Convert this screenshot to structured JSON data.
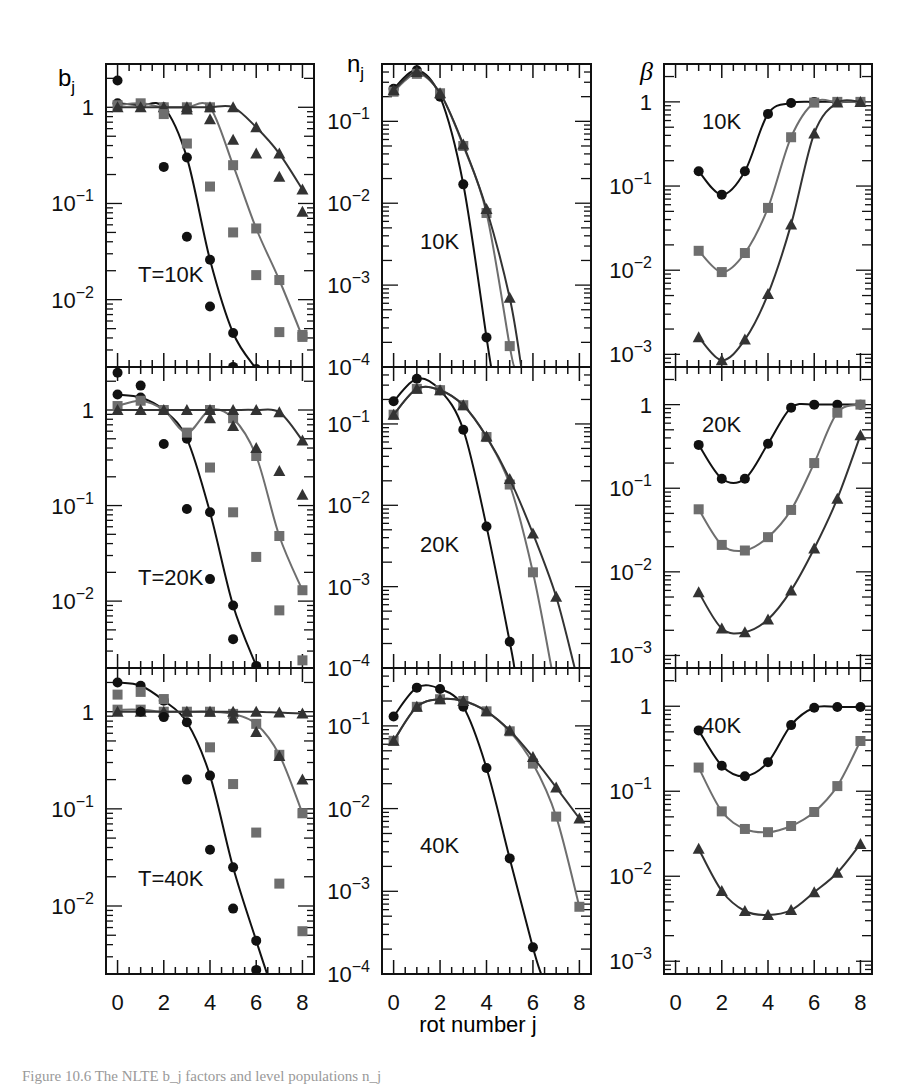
{
  "chart_data": {
    "type": "line",
    "layout": "3x3 grid of log-scale panels",
    "xlabel": "rot number j",
    "x_ticks": [
      0,
      2,
      4,
      6,
      8
    ],
    "x_range": [
      -0.5,
      8.5
    ],
    "column_ylabels": [
      "b_j",
      "n_j",
      "β"
    ],
    "series_styles": [
      {
        "name": "circles",
        "marker": "circle",
        "color": "#111111"
      },
      {
        "name": "squares",
        "marker": "square",
        "color": "#6e6e6e"
      },
      {
        "name": "triangles",
        "marker": "triangle",
        "color": "#333333"
      }
    ],
    "panels": [
      {
        "id": "bj-10K",
        "column": 0,
        "row": 0,
        "label": "T=10K",
        "ylabel": "b_j",
        "yticks": [
          "1",
          "10^-1",
          "10^-2"
        ],
        "ylog_range": [
          -2.7,
          0.45
        ],
        "curves": [
          {
            "marker": "circle",
            "x": [
              0,
              1,
              2,
              3,
              4,
              5,
              6
            ],
            "y": [
              1.1,
              1.05,
              1.0,
              0.3,
              0.026,
              0.0045,
              0.0019
            ]
          },
          {
            "marker": "square",
            "x": [
              0,
              1,
              2,
              3,
              4,
              5,
              6,
              7,
              8
            ],
            "y": [
              1.05,
              1.1,
              1.0,
              1.0,
              1.0,
              0.25,
              0.055,
              0.016,
              0.0041
            ]
          },
          {
            "marker": "triangle",
            "x": [
              0,
              1,
              2,
              3,
              4,
              5,
              6,
              7,
              8
            ],
            "y": [
              1.0,
              1.0,
              1.0,
              1.0,
              1.0,
              1.0,
              0.62,
              0.33,
              0.14
            ]
          }
        ],
        "scatter": [
          {
            "marker": "circle",
            "x": [
              0,
              2,
              3,
              4,
              5,
              6
            ],
            "y": [
              1.9,
              0.24,
              0.045,
              0.0085,
              0.002,
              0.00115
            ]
          },
          {
            "marker": "square",
            "x": [
              2,
              3,
              4,
              5,
              6,
              7,
              8
            ],
            "y": [
              0.85,
              0.42,
              0.15,
              0.05,
              0.018,
              0.0046,
              0.0043
            ]
          },
          {
            "marker": "triangle",
            "x": [
              3,
              4,
              5,
              6,
              7,
              8
            ],
            "y": [
              0.95,
              0.75,
              0.46,
              0.33,
              0.19,
              0.082
            ]
          }
        ]
      },
      {
        "id": "nj-10K",
        "column": 1,
        "row": 0,
        "label": "10K",
        "ylabel": "n_j",
        "yticks": [
          "10^-1",
          "10^-2",
          "10^-3",
          "10^-4"
        ],
        "ylog_range": [
          -4.0,
          -0.3
        ],
        "curves": [
          {
            "marker": "circle",
            "x": [
              0,
              1,
              2,
              3,
              4,
              4.2
            ],
            "y": [
              0.25,
              0.42,
              0.2,
              0.017,
              0.00023,
              0.0001
            ]
          },
          {
            "marker": "square",
            "x": [
              0,
              1,
              2,
              3,
              4,
              5,
              5.2
            ],
            "y": [
              0.23,
              0.38,
              0.22,
              0.05,
              0.0076,
              0.00018,
              0.0001
            ]
          },
          {
            "marker": "triangle",
            "x": [
              0,
              1,
              2,
              3,
              4,
              5,
              5.5
            ],
            "y": [
              0.24,
              0.4,
              0.22,
              0.052,
              0.0085,
              0.0007,
              0.0001
            ]
          }
        ],
        "scatter": []
      },
      {
        "id": "beta-10K",
        "column": 2,
        "row": 0,
        "label": "10K",
        "ylabel": "β",
        "yticks": [
          "1",
          "10^-1",
          "10^-2",
          "10^-3"
        ],
        "ylog_range": [
          -3.15,
          0.45
        ],
        "curves": [
          {
            "marker": "circle",
            "x": [
              1,
              2,
              3,
              4,
              5,
              6,
              7,
              8
            ],
            "y": [
              0.15,
              0.079,
              0.15,
              0.72,
              0.97,
              1.0,
              1.0,
              1.0
            ]
          },
          {
            "marker": "square",
            "x": [
              1,
              2,
              3,
              4,
              5,
              6,
              7,
              8
            ],
            "y": [
              0.017,
              0.0095,
              0.016,
              0.055,
              0.38,
              0.98,
              1.0,
              1.0
            ]
          },
          {
            "marker": "triangle",
            "x": [
              1,
              2,
              3,
              4,
              5,
              6,
              7,
              8
            ],
            "y": [
              0.0016,
              0.00085,
              0.0015,
              0.0052,
              0.035,
              0.42,
              0.98,
              1.0
            ]
          }
        ],
        "scatter": []
      },
      {
        "id": "bj-20K",
        "column": 0,
        "row": 1,
        "label": "T=20K",
        "ylabel": "b_j",
        "yticks": [
          "1",
          "10^-1",
          "10^-2"
        ],
        "ylog_range": [
          -2.7,
          0.45
        ],
        "curves": [
          {
            "marker": "circle",
            "x": [
              0,
              1,
              2,
              3,
              4,
              5,
              6
            ],
            "y": [
              1.45,
              1.35,
              1.0,
              0.5,
              0.085,
              0.009,
              0.0021
            ]
          },
          {
            "marker": "square",
            "x": [
              0,
              1,
              2,
              3,
              4,
              5,
              6,
              7,
              8
            ],
            "y": [
              1.1,
              1.25,
              1.0,
              0.58,
              1.0,
              0.82,
              0.33,
              0.048,
              0.013
            ]
          },
          {
            "marker": "triangle",
            "x": [
              0,
              1,
              2,
              3,
              4,
              5,
              6,
              7,
              8
            ],
            "y": [
              1.0,
              1.0,
              1.0,
              1.0,
              1.0,
              1.0,
              1.0,
              0.95,
              0.48
            ]
          }
        ],
        "scatter": [
          {
            "marker": "circle",
            "x": [
              0,
              1,
              2,
              3,
              4,
              5
            ],
            "y": [
              2.45,
              1.8,
              0.44,
              0.092,
              0.017,
              0.004
            ]
          },
          {
            "marker": "square",
            "x": [
              4,
              5,
              6,
              7,
              8
            ],
            "y": [
              0.25,
              0.085,
              0.029,
              0.008,
              0.0024
            ]
          },
          {
            "marker": "triangle",
            "x": [
              4,
              5,
              6,
              7,
              8
            ],
            "y": [
              0.82,
              0.68,
              0.4,
              0.23,
              0.13
            ]
          }
        ]
      },
      {
        "id": "nj-20K",
        "column": 1,
        "row": 1,
        "label": "20K",
        "ylabel": "n_j",
        "yticks": [
          "10^-1",
          "10^-2",
          "10^-3",
          "10^-4"
        ],
        "ylog_range": [
          -4.0,
          -0.3
        ],
        "curves": [
          {
            "marker": "circle",
            "x": [
              0,
              1,
              2,
              3,
              4,
              5,
              5.2
            ],
            "y": [
              0.19,
              0.36,
              0.26,
              0.085,
              0.0055,
              0.00021,
              0.0001
            ]
          },
          {
            "marker": "square",
            "x": [
              0,
              1,
              2,
              3,
              4,
              5,
              6,
              6.8
            ],
            "y": [
              0.13,
              0.27,
              0.26,
              0.17,
              0.069,
              0.018,
              0.0015,
              0.0001
            ]
          },
          {
            "marker": "triangle",
            "x": [
              0,
              1,
              2,
              3,
              4,
              5,
              6,
              7,
              7.8
            ],
            "y": [
              0.13,
              0.27,
              0.26,
              0.17,
              0.07,
              0.021,
              0.0045,
              0.00075,
              0.0001
            ]
          }
        ],
        "scatter": []
      },
      {
        "id": "beta-20K",
        "column": 2,
        "row": 1,
        "label": "20K",
        "ylabel": "β",
        "yticks": [
          "1",
          "10^-1",
          "10^-2",
          "10^-3"
        ],
        "ylog_range": [
          -3.15,
          0.45
        ],
        "curves": [
          {
            "marker": "circle",
            "x": [
              1,
              2,
              3,
              4,
              5,
              6,
              7,
              8
            ],
            "y": [
              0.33,
              0.13,
              0.13,
              0.34,
              0.92,
              1.0,
              1.0,
              1.0
            ]
          },
          {
            "marker": "square",
            "x": [
              1,
              2,
              3,
              4,
              5,
              6,
              7,
              8
            ],
            "y": [
              0.056,
              0.021,
              0.018,
              0.026,
              0.055,
              0.2,
              0.8,
              1.0
            ]
          },
          {
            "marker": "triangle",
            "x": [
              1,
              2,
              3,
              4,
              5,
              6,
              7,
              8
            ],
            "y": [
              0.0057,
              0.0021,
              0.0019,
              0.0027,
              0.006,
              0.019,
              0.075,
              0.43
            ]
          }
        ],
        "scatter": []
      },
      {
        "id": "bj-40K",
        "column": 0,
        "row": 2,
        "label": "T=40K",
        "ylabel": "b_j",
        "yticks": [
          "1",
          "10^-1",
          "10^-2"
        ],
        "ylog_range": [
          -2.7,
          0.45
        ],
        "curves": [
          {
            "marker": "circle",
            "x": [
              0,
              1,
              2,
              3,
              4,
              5,
              6,
              6.5
            ],
            "y": [
              2.0,
              1.85,
              1.3,
              0.78,
              0.22,
              0.025,
              0.0044,
              0.0019
            ]
          },
          {
            "marker": "square",
            "x": [
              0,
              1,
              2,
              3,
              4,
              5,
              6,
              7,
              8
            ],
            "y": [
              1.05,
              1.05,
              1.0,
              1.0,
              1.0,
              0.95,
              0.75,
              0.36,
              0.09
            ]
          },
          {
            "marker": "triangle",
            "x": [
              0,
              1,
              2,
              3,
              4,
              5,
              6,
              7,
              8
            ],
            "y": [
              1.0,
              1.0,
              1.0,
              1.0,
              1.0,
              1.0,
              1.0,
              0.98,
              0.96
            ]
          }
        ],
        "scatter": [
          {
            "marker": "circle",
            "x": [
              1,
              2,
              3,
              4,
              5,
              6
            ],
            "y": [
              1.0,
              0.88,
              0.2,
              0.038,
              0.0094,
              0.0022
            ]
          },
          {
            "marker": "square",
            "x": [
              0,
              1,
              2,
              4,
              5,
              6,
              7,
              8
            ],
            "y": [
              1.5,
              1.6,
              1.35,
              0.43,
              0.18,
              0.057,
              0.017,
              0.0055
            ]
          },
          {
            "marker": "triangle",
            "x": [
              5,
              6,
              7,
              8
            ],
            "y": [
              0.85,
              0.62,
              0.35,
              0.2
            ]
          }
        ]
      },
      {
        "id": "nj-40K",
        "column": 1,
        "row": 2,
        "label": "40K",
        "ylabel": "n_j",
        "yticks": [
          "10^-1",
          "10^-2",
          "10^-3",
          "10^-4"
        ],
        "ylog_range": [
          -4.0,
          -0.3
        ],
        "curves": [
          {
            "marker": "circle",
            "x": [
              0,
              1,
              2,
              3,
              4,
              5,
              6,
              6.35
            ],
            "y": [
              0.13,
              0.29,
              0.28,
              0.17,
              0.031,
              0.0025,
              0.00021,
              0.0001
            ]
          },
          {
            "marker": "square",
            "x": [
              0,
              1,
              2,
              3,
              4,
              5,
              6,
              7,
              8
            ],
            "y": [
              0.066,
              0.17,
              0.21,
              0.2,
              0.15,
              0.086,
              0.035,
              0.008,
              0.00065
            ]
          },
          {
            "marker": "triangle",
            "x": [
              0,
              1,
              2,
              3,
              4,
              5,
              6,
              7,
              8
            ],
            "y": [
              0.066,
              0.17,
              0.21,
              0.2,
              0.15,
              0.088,
              0.042,
              0.018,
              0.0076
            ]
          }
        ],
        "scatter": []
      },
      {
        "id": "beta-40K",
        "column": 2,
        "row": 2,
        "label": "40K",
        "ylabel": "β",
        "yticks": [
          "1",
          "10^-1",
          "10^-2",
          "10^-3"
        ],
        "ylog_range": [
          -3.15,
          0.45
        ],
        "curves": [
          {
            "marker": "circle",
            "x": [
              1,
              2,
              3,
              4,
              5,
              6,
              7,
              8
            ],
            "y": [
              0.52,
              0.2,
              0.15,
              0.22,
              0.6,
              0.96,
              0.98,
              0.98
            ]
          },
          {
            "marker": "square",
            "x": [
              1,
              2,
              3,
              4,
              5,
              6,
              7,
              8
            ],
            "y": [
              0.19,
              0.058,
              0.036,
              0.033,
              0.039,
              0.057,
              0.115,
              0.39
            ]
          },
          {
            "marker": "triangle",
            "x": [
              1,
              2,
              3,
              4,
              5,
              6,
              7,
              8
            ],
            "y": [
              0.021,
              0.0067,
              0.0039,
              0.0035,
              0.004,
              0.0065,
              0.011,
              0.024
            ]
          }
        ],
        "scatter": []
      }
    ]
  },
  "labels": {
    "xlabel": "rot number j",
    "ylabel_bj": "b",
    "ylabel_bj_sub": "j",
    "ylabel_nj": "n",
    "ylabel_nj_sub": "j",
    "ylabel_beta": "β"
  },
  "caption": "Figure 10.6  The NLTE b_j factors and level populations n_j"
}
